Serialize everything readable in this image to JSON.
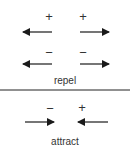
{
  "diagram": {
    "repel": {
      "label": "repel",
      "rows": [
        {
          "charges": [
            "+",
            "+"
          ],
          "arrows": [
            "left",
            "right"
          ]
        },
        {
          "charges": [
            "−",
            "−"
          ],
          "arrows": [
            "left",
            "right"
          ]
        }
      ]
    },
    "attract": {
      "label": "attract",
      "charges": [
        "−",
        "+"
      ],
      "arrows": [
        "right",
        "left"
      ]
    },
    "colors": {
      "ink": "#1a1a1a",
      "text": "#333333",
      "divider": "#222222"
    }
  }
}
